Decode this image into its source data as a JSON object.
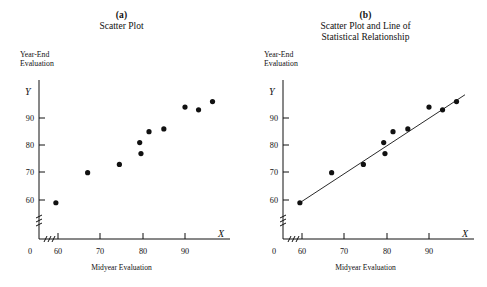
{
  "figure": {
    "background": "#ffffff",
    "ink_color": "#111111"
  },
  "panels": [
    {
      "letter": "(a)",
      "title_lines": [
        "Scatter Plot"
      ],
      "y_axis_caption_lines": [
        "Year-End",
        "Evaluation"
      ],
      "y_symbol": "Y",
      "x_symbol": "X",
      "x_axis_caption": "Midyear Evaluation",
      "show_regression_line": false
    },
    {
      "letter": "(b)",
      "title_lines": [
        "Scatter Plot and Line of",
        "Statistical Relationship"
      ],
      "y_axis_caption_lines": [
        "Year-End",
        "Evaluation"
      ],
      "y_symbol": "Y",
      "x_symbol": "X",
      "x_axis_caption": "Midyear Evaluation",
      "show_regression_line": true
    }
  ],
  "chart_data": {
    "type": "scatter",
    "title": "Scatter Plot and Line of Statistical Relationship",
    "xlabel": "Midyear Evaluation",
    "ylabel": "Year-End Evaluation",
    "x_symbol": "X",
    "y_symbol": "Y",
    "xlim": [
      57,
      99
    ],
    "ylim": [
      56,
      99
    ],
    "x_ticks": [
      60,
      70,
      80,
      90
    ],
    "y_ticks": [
      60,
      70,
      80,
      90
    ],
    "x_origin_label": "0",
    "axis_break": true,
    "grid": false,
    "legend": "none",
    "marker": "filled-circle",
    "points": [
      {
        "x": 59.5,
        "y": 59.0
      },
      {
        "x": 67.0,
        "y": 70.0
      },
      {
        "x": 74.5,
        "y": 73.0
      },
      {
        "x": 79.3,
        "y": 81.0
      },
      {
        "x": 79.6,
        "y": 77.0
      },
      {
        "x": 81.5,
        "y": 85.0
      },
      {
        "x": 85.0,
        "y": 86.0
      },
      {
        "x": 90.0,
        "y": 94.0
      },
      {
        "x": 93.2,
        "y": 93.0
      },
      {
        "x": 96.5,
        "y": 96.0
      }
    ],
    "regression_line": {
      "x_start": 59.5,
      "y_start": 59.0,
      "x_end": 98.5,
      "y_end": 98.5,
      "label": "Line of Statistical Relationship"
    }
  }
}
